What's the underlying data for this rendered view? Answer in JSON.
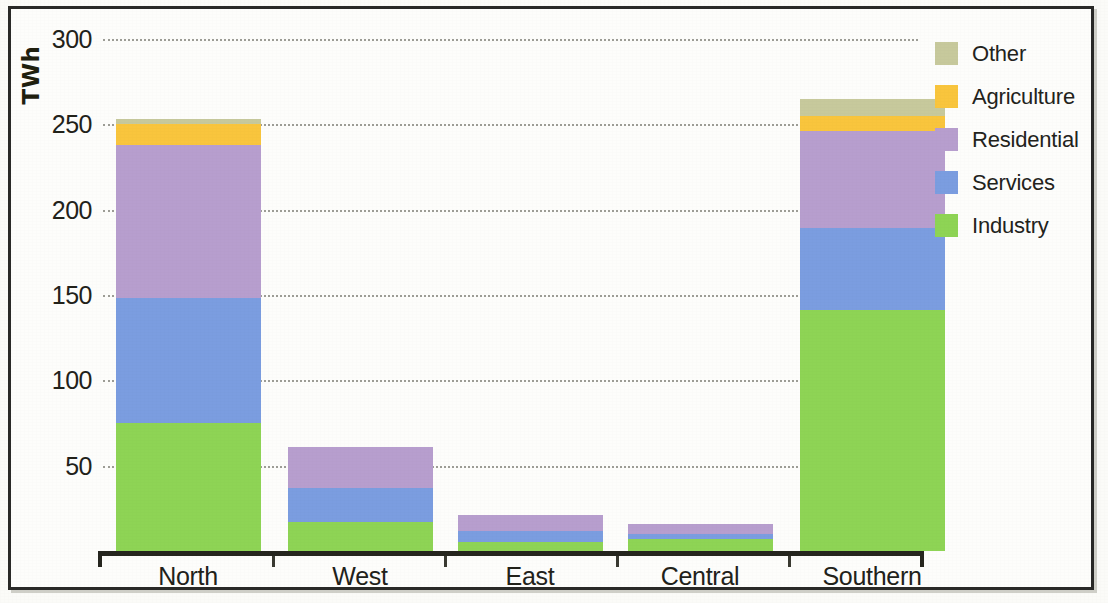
{
  "chart_data": {
    "type": "bar",
    "stacked": true,
    "title": "",
    "xlabel": "",
    "ylabel": "TWh",
    "ylim": [
      0,
      300
    ],
    "yticks": [
      50,
      100,
      150,
      200,
      250,
      300
    ],
    "ytick_labels": [
      "50",
      "100",
      "150",
      "200",
      "250",
      "300"
    ],
    "grid": true,
    "grid_axis": "y",
    "legend_position": "right",
    "categories": [
      "North",
      "West",
      "East",
      "Central",
      "Southern"
    ],
    "series": [
      {
        "name": "Industry",
        "color": "#8ED455",
        "values": [
          75,
          17,
          5,
          7,
          141
        ]
      },
      {
        "name": "Services",
        "color": "#7B9DE0",
        "values": [
          73,
          20,
          7,
          3,
          48
        ]
      },
      {
        "name": "Residential",
        "color": "#B79ECE",
        "values": [
          90,
          24,
          9,
          6,
          57
        ]
      },
      {
        "name": "Agriculture",
        "color": "#F9C githubusercontent"
      }
    ]
  }
}
